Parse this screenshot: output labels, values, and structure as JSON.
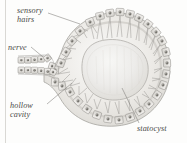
{
  "figure": {
    "background_color": "#fdfdfc",
    "ink_color": "#4a4a48"
  },
  "labels": {
    "sensory_hairs": "sensory\nhairs",
    "sensory_hairs_line1": "sensory",
    "sensory_hairs_line2": "hairs",
    "nerve": "nerve",
    "hollow_cavity_line1": "hollow",
    "hollow_cavity_line2": "cavity",
    "statocyst": "statocyst"
  },
  "icons": {
    "leader_line": "leader-line",
    "cell_ring": "epithelial-cell-ring",
    "nucleus": "cell-nucleus",
    "sensory_hair": "sensory-hair-bristle",
    "statolith": "statolith-mass",
    "nerve_cord": "nerve-cord"
  },
  "colors": {
    "cell_outline": "#8f8d89",
    "cell_fill": "#e8e6e2",
    "nucleus_fill": "#6d6b67",
    "cavity_fill": "#f2f1ee",
    "statolith_fill": "#ededea",
    "statolith_edge": "#b8b6b1",
    "hair_stroke": "#9b9995",
    "leader_stroke": "#7d7b77",
    "rule_color": "#d9d8d4"
  },
  "anatomy": {
    "structures": [
      "sensory hairs",
      "nerve",
      "hollow cavity",
      "statocyst"
    ],
    "cell_count_ring": 34,
    "nerve_cell_rows": 2
  }
}
